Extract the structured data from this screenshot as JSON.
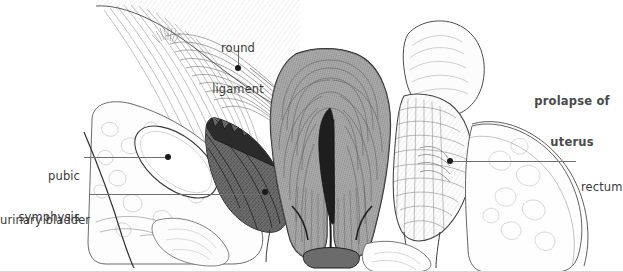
{
  "figure": {
    "width": 623,
    "height": 272,
    "background": "#ffffff",
    "line_color": "#6e6e6e",
    "text_color": "#3a3a3a",
    "dot_color": "#1a1a1a"
  },
  "labels": {
    "round_ligament": {
      "line1": "round",
      "line2": "ligament"
    },
    "prolapse_of_uterus": {
      "line1": "prolapse of",
      "line2": "uterus"
    },
    "pubic_symphysis": {
      "line1": "pubic",
      "line2": "symphysis"
    },
    "urinary_bladder": {
      "line1": "urinary bladder"
    },
    "rectum": {
      "line1": "rectum"
    }
  },
  "structures": [
    {
      "name": "abdominal-wall-fascia",
      "tone": "light-hatched"
    },
    {
      "name": "round-ligament",
      "tone": "hatched"
    },
    {
      "name": "pubic-symphysis",
      "tone": "white-oval"
    },
    {
      "name": "urinary-bladder",
      "tone": "dark-stippled"
    },
    {
      "name": "prolapsed-uterus",
      "tone": "dense-gray-hatched"
    },
    {
      "name": "uterine-cavity",
      "tone": "dark-slit"
    },
    {
      "name": "rectum",
      "tone": "light-hatched"
    },
    {
      "name": "sigmoid-colon",
      "tone": "light-outline"
    },
    {
      "name": "gluteal-soft-tissue",
      "tone": "light-outline"
    }
  ]
}
